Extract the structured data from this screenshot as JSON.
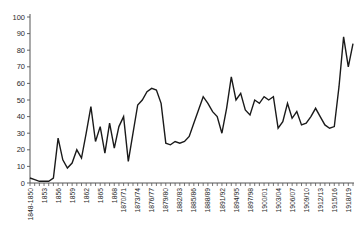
{
  "chart_data": {
    "type": "line",
    "title": "",
    "xlabel": "",
    "ylabel": "",
    "ylim": [
      0,
      100
    ],
    "grid": false,
    "legend": "none",
    "line_color": "#1a1a1a",
    "axis_color": "#555555",
    "tick_label_color": "#2b2b2b",
    "background_color": "#ffffff",
    "y_ticks": [
      0,
      10,
      20,
      30,
      40,
      50,
      60,
      70,
      80,
      90,
      100
    ],
    "n_points": 70,
    "x_tick_labels": [
      {
        "index": 0,
        "label": "1848-1850"
      },
      {
        "index": 3,
        "label": "1853"
      },
      {
        "index": 6,
        "label": "1856"
      },
      {
        "index": 9,
        "label": "1859"
      },
      {
        "index": 12,
        "label": "1862"
      },
      {
        "index": 15,
        "label": "1865"
      },
      {
        "index": 18,
        "label": "1868"
      },
      {
        "index": 20,
        "label": "1870/71"
      },
      {
        "index": 23,
        "label": "1873/74"
      },
      {
        "index": 26,
        "label": "1876/77"
      },
      {
        "index": 29,
        "label": "1879/80"
      },
      {
        "index": 32,
        "label": "1882/83"
      },
      {
        "index": 35,
        "label": "1885/86"
      },
      {
        "index": 38,
        "label": "1888/89"
      },
      {
        "index": 41,
        "label": "1891/92"
      },
      {
        "index": 44,
        "label": "1894/95"
      },
      {
        "index": 47,
        "label": "1897/98"
      },
      {
        "index": 50,
        "label": "1900/01"
      },
      {
        "index": 53,
        "label": "1903/04"
      },
      {
        "index": 56,
        "label": "1906/07"
      },
      {
        "index": 59,
        "label": "1909/10"
      },
      {
        "index": 62,
        "label": "1912/13"
      },
      {
        "index": 65,
        "label": "1915/16"
      },
      {
        "index": 68,
        "label": "1918/19"
      }
    ],
    "values": [
      3,
      2,
      1,
      1,
      1,
      3,
      27,
      14,
      9,
      12,
      20,
      15,
      30,
      46,
      25,
      34,
      18,
      36,
      21,
      34,
      40,
      13,
      30,
      47,
      50,
      55,
      57,
      56,
      48,
      24,
      23,
      25,
      24,
      25,
      28,
      36,
      44,
      52,
      48,
      43,
      40,
      30,
      45,
      64,
      50,
      54,
      44,
      41,
      50,
      48,
      52,
      50,
      52,
      33,
      37,
      48,
      39,
      43,
      35,
      36,
      40,
      45,
      40,
      35,
      33,
      34,
      58,
      88,
      70,
      84
    ]
  }
}
